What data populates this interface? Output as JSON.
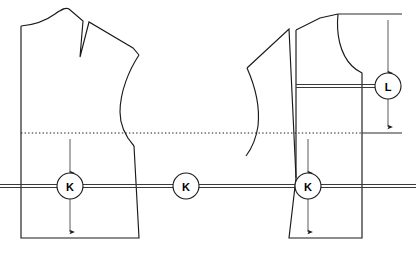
{
  "figure": {
    "background_color": "#ffffff",
    "line_color": "#1a1a1a",
    "dimension_line_color": "#5a5a5a"
  },
  "callouts": [
    {
      "id": "k-left",
      "label": "K",
      "cx": 70,
      "cy": 186,
      "r": 13
    },
    {
      "id": "k-center",
      "label": "K",
      "cx": 186,
      "cy": 186,
      "r": 13
    },
    {
      "id": "k-right",
      "label": "K",
      "cx": 308,
      "cy": 186,
      "r": 13
    },
    {
      "id": "l-right",
      "label": "L",
      "cx": 388,
      "cy": 86,
      "r": 13
    }
  ],
  "dimensions": [
    {
      "id": "k-left-vertical",
      "label": "K",
      "x": 70,
      "top": 134,
      "bottom": 238
    },
    {
      "id": "k-right-vertical",
      "label": "K",
      "x": 308,
      "top": 134,
      "bottom": 238
    },
    {
      "id": "l-right-vertical",
      "label": "L",
      "x": 388,
      "top": 14,
      "bottom": 133
    }
  ],
  "guides": {
    "waistline": {
      "id": "waistline-dotted",
      "y": 133,
      "x1": 21,
      "x2": 362,
      "style": "dotted"
    },
    "bustline": {
      "id": "bustline-double",
      "y": 186,
      "x1": 0,
      "x2": 416,
      "style": "double-solid"
    },
    "top_extension": {
      "id": "top-reference-line",
      "y": 14,
      "x1": 338,
      "x2": 400
    },
    "waist_extension": {
      "id": "waist-reference-line",
      "y": 133,
      "x1": 362,
      "x2": 400
    }
  },
  "pieces": {
    "left_bodice": {
      "name": "left-bodice-front",
      "has_shoulder_dart": true,
      "has_armhole_curve": true
    },
    "right_bodice": {
      "name": "right-bodice-front",
      "has_rotated_dart": true,
      "has_armhole_curve": true
    }
  }
}
